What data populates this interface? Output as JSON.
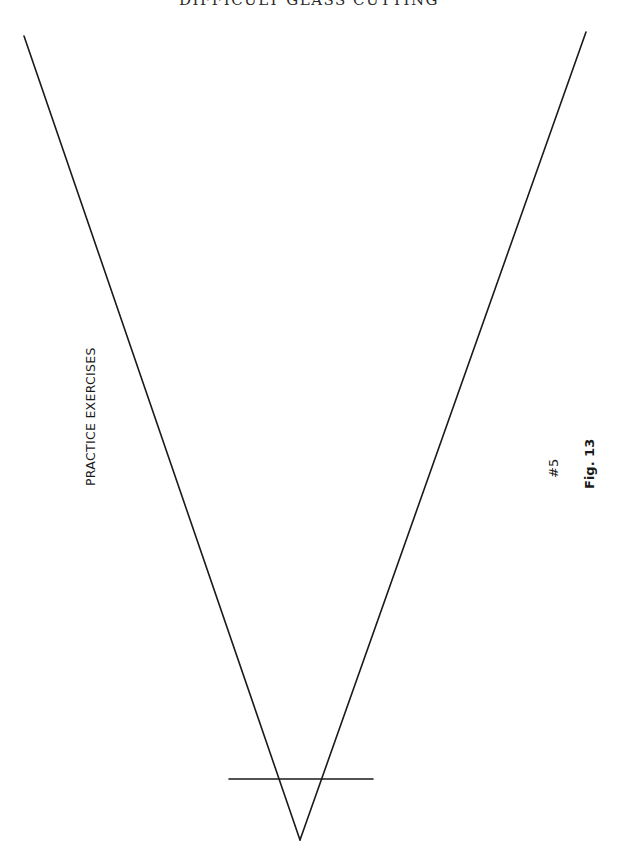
{
  "page": {
    "running_header": "DIFFICULT GLASS CUTTING",
    "section_label": "PRACTICE EXERCISES",
    "exercise_number": "#5",
    "figure_label": "Fig. 13"
  },
  "figure": {
    "stroke_color": "#1a1a1a",
    "lines": [
      {
        "name": "left-line",
        "x1": 24,
        "y1": 36,
        "x2": 300,
        "y2": 840
      },
      {
        "name": "right-line",
        "x1": 586,
        "y1": 32,
        "x2": 300,
        "y2": 840
      },
      {
        "name": "crossbar-line",
        "x1": 229,
        "y1": 779,
        "x2": 373,
        "y2": 779
      }
    ]
  }
}
